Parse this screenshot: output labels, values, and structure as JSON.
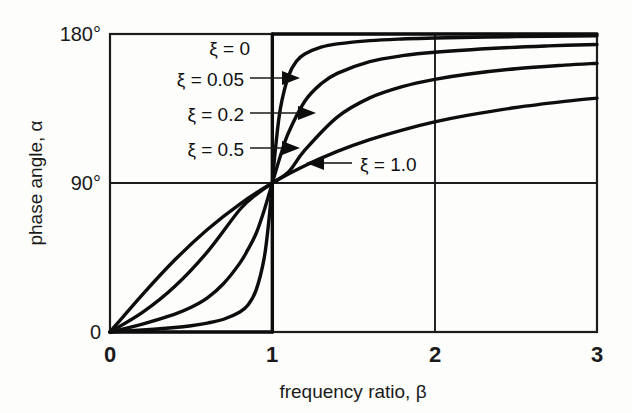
{
  "chart_data": {
    "type": "line",
    "title": "",
    "xlabel": "frequency ratio, β",
    "ylabel": "phase angle, α",
    "xlim": [
      0,
      3
    ],
    "ylim": [
      0,
      180
    ],
    "xticks": [
      "0",
      "1",
      "2",
      "3"
    ],
    "xtick_values": [
      0,
      1,
      2,
      3
    ],
    "yticks": [
      "0",
      "90°",
      "180°"
    ],
    "ytick_values": [
      0,
      90,
      180
    ],
    "grid": true,
    "grid_lines": [
      "vertical at β=1",
      "vertical at β=2",
      "horizontal at α=90°"
    ],
    "legend_position": "inside-annotations",
    "formula": "α = arctan( 2ξβ / (1 - β²) )",
    "series": [
      {
        "name": "ξ = 0",
        "label": "ξ = 0",
        "damping_ratio": 0,
        "has_leader_arrow": false,
        "x": [
          0,
          0.2,
          0.4,
          0.6,
          0.8,
          0.9,
          0.95,
          0.99,
          1,
          1,
          1.01,
          1.05,
          1.1,
          1.2,
          1.4,
          1.6,
          2,
          2.5,
          3
        ],
        "y": [
          0,
          0,
          0,
          0,
          0,
          0,
          0,
          0,
          0,
          180,
          180,
          180,
          180,
          180,
          180,
          180,
          180,
          180,
          180
        ]
      },
      {
        "name": "ξ = 0.05",
        "label": "ξ = 0.05",
        "damping_ratio": 0.05,
        "has_leader_arrow": true,
        "x": [
          0,
          0.2,
          0.4,
          0.5,
          0.6,
          0.7,
          0.8,
          0.85,
          0.9,
          0.95,
          0.98,
          1,
          1.02,
          1.05,
          1.1,
          1.15,
          1.2,
          1.3,
          1.4,
          1.6,
          1.8,
          2,
          2.5,
          3
        ],
        "y": [
          0,
          1.2,
          2.7,
          3.8,
          5.4,
          7.7,
          12.1,
          16.3,
          25.3,
          44.8,
          68.6,
          90,
          111.4,
          135.2,
          154.7,
          163.7,
          167.9,
          172.0,
          174.0,
          176.0,
          177.0,
          177.6,
          178.4,
          178.9
        ]
      },
      {
        "name": "ξ = 0.2",
        "label": "ξ = 0.2",
        "damping_ratio": 0.2,
        "has_leader_arrow": true,
        "x": [
          0,
          0.2,
          0.4,
          0.5,
          0.6,
          0.7,
          0.8,
          0.85,
          0.9,
          0.95,
          1,
          1.05,
          1.1,
          1.2,
          1.3,
          1.4,
          1.6,
          1.8,
          2,
          2.4,
          2.7,
          3
        ],
        "y": [
          0,
          4.8,
          10.8,
          14.9,
          20.6,
          29.3,
          41.6,
          49.9,
          59.5,
          73.6,
          90,
          106.4,
          120.5,
          139.4,
          149.9,
          156.2,
          163.3,
          166.9,
          169.0,
          171.5,
          172.8,
          173.7
        ]
      },
      {
        "name": "ξ = 0.5",
        "label": "ξ = 0.5",
        "damping_ratio": 0.5,
        "has_leader_arrow": true,
        "x": [
          0,
          0.2,
          0.4,
          0.6,
          0.8,
          0.9,
          1,
          1.1,
          1.2,
          1.4,
          1.6,
          1.8,
          2,
          2.2,
          2.5,
          2.8,
          3
        ],
        "y": [
          0,
          11.8,
          27.6,
          48.4,
          74.0,
          83.0,
          90,
          96.6,
          109.8,
          129.8,
          141.4,
          148.2,
          152.6,
          155.7,
          159.0,
          161.2,
          162.3
        ]
      },
      {
        "name": "ξ = 1.0",
        "label": "ξ = 1.0",
        "damping_ratio": 1.0,
        "has_leader_arrow": true,
        "x": [
          0,
          0.2,
          0.4,
          0.6,
          0.8,
          1,
          1.2,
          1.4,
          1.6,
          1.8,
          2,
          2.2,
          2.5,
          2.8,
          3
        ],
        "y": [
          0,
          22.6,
          43.6,
          61.9,
          77.3,
          90,
          100.4,
          109.1,
          116.2,
          122.0,
          126.9,
          130.8,
          135.6,
          139.3,
          141.3
        ]
      }
    ]
  },
  "annotations": {
    "xi_0": "ξ = 0",
    "xi_005": "ξ = 0.05",
    "xi_02": "ξ = 0.2",
    "xi_05": "ξ = 0.5",
    "xi_10": "ξ = 1.0"
  },
  "axes": {
    "y_tick_180": "180°",
    "y_tick_90": "90°",
    "y_tick_0": "0",
    "x_tick_0": "0",
    "x_tick_1": "1",
    "x_tick_2": "2",
    "x_tick_3": "3",
    "x_title": "frequency ratio, β",
    "y_title": "phase angle, α"
  },
  "colors": {
    "ink": "#0d0d0d",
    "background": "#fdfdfc",
    "axis": "#1c1c1c"
  }
}
